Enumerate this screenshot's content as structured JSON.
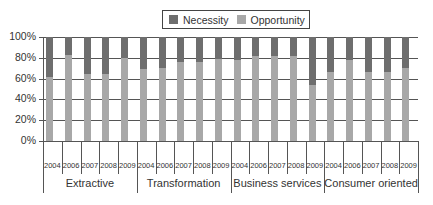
{
  "chart_data": {
    "type": "bar",
    "stacked": true,
    "percent": true,
    "title": "",
    "xlabel": "",
    "ylabel": "",
    "ylim": [
      0,
      100
    ],
    "yticks": [
      "0%",
      "20%",
      "40%",
      "60%",
      "80%",
      "100%"
    ],
    "grid": true,
    "legend_position": "top",
    "groups": [
      "Extractive",
      "Transformation",
      "Business services",
      "Consumer oriented"
    ],
    "years": [
      "2004",
      "2006",
      "2007",
      "2008",
      "2009"
    ],
    "categories": [
      "Extractive 2004",
      "Extractive 2006",
      "Extractive 2007",
      "Extractive 2008",
      "Extractive 2009",
      "Transformation 2004",
      "Transformation 2006",
      "Transformation 2007",
      "Transformation 2008",
      "Transformation 2009",
      "Business services 2004",
      "Business services 2006",
      "Business services 2007",
      "Business services 2008",
      "Business services 2009",
      "Consumer oriented 2004",
      "Consumer oriented 2006",
      "Consumer oriented 2007",
      "Consumer oriented 2008",
      "Consumer oriented 2009"
    ],
    "series": [
      {
        "name": "Necessity",
        "color": "#6e6e6e",
        "values": [
          38,
          17,
          36,
          36,
          20,
          31,
          30,
          24,
          24,
          21,
          22,
          18,
          18,
          18,
          46,
          34,
          22,
          34,
          34,
          30
        ]
      },
      {
        "name": "Opportunity",
        "color": "#a8a8a8",
        "values": [
          62,
          83,
          64,
          64,
          80,
          69,
          70,
          76,
          76,
          79,
          78,
          82,
          82,
          82,
          54,
          66,
          78,
          66,
          66,
          70
        ]
      }
    ]
  },
  "legend": [
    {
      "label": "Necessity",
      "color": "#6e6e6e"
    },
    {
      "label": "Opportunity",
      "color": "#a8a8a8"
    }
  ]
}
